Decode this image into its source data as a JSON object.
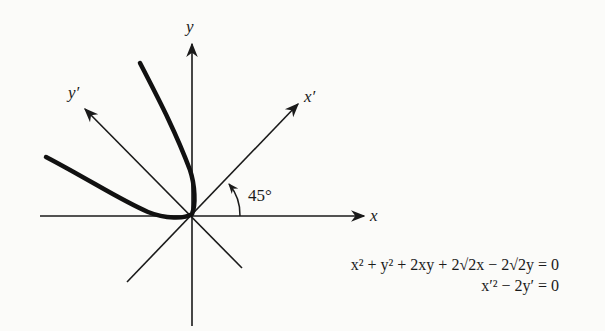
{
  "diagram": {
    "axes": {
      "x_label": "x",
      "y_label": "y",
      "x_prime_label": "x′",
      "y_prime_label": "y′"
    },
    "angle_label": "45°",
    "equations": {
      "original": "x² + y² + 2xy + 2√2x − 2√2y = 0",
      "rotated": "x′² − 2y′ = 0"
    },
    "colors": {
      "ink": "#1a1a1a",
      "background": "#fbfbf9"
    }
  }
}
